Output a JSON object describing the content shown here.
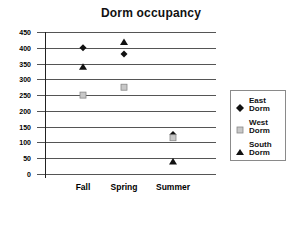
{
  "chart_data": {
    "type": "scatter",
    "title": "Dorm occupancy",
    "xlabel": "",
    "ylabel": "",
    "categories": [
      "Fall",
      "Spring",
      "Summer"
    ],
    "series": [
      {
        "name": "East Dorm",
        "marker": "diamond",
        "color": "#111111",
        "values": [
          400,
          380,
          125
        ]
      },
      {
        "name": "West Dorm",
        "marker": "square",
        "color": "#b0b0b0",
        "values": [
          250,
          275,
          115
        ]
      },
      {
        "name": "South Dorm",
        "marker": "triangle",
        "color": "#111111",
        "values": [
          340,
          418,
          40
        ]
      }
    ],
    "ylim": [
      0,
      450
    ],
    "yticks": [
      0,
      50,
      100,
      150,
      200,
      250,
      300,
      350,
      400,
      450
    ],
    "grid": true,
    "legend_position": "right"
  },
  "legend": {
    "items": [
      {
        "line1": "East",
        "line2": "Dorm"
      },
      {
        "line1": "West",
        "line2": "Dorm"
      },
      {
        "line1": "South",
        "line2": "Dorm"
      }
    ]
  }
}
